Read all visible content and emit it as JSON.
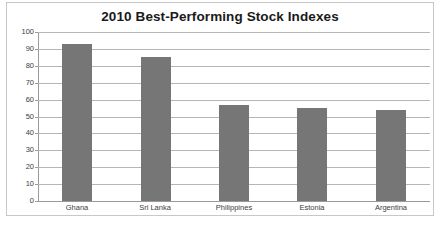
{
  "chart_data": {
    "type": "bar",
    "title": "2010 Best-Performing Stock Indexes",
    "categories": [
      "Ghana",
      "Sri Lanka",
      "Philippines",
      "Estonia",
      "Argentina"
    ],
    "values": [
      93,
      85,
      57,
      55,
      54
    ],
    "series": [
      {
        "name": "2010 return",
        "values": [
          93,
          85,
          57,
          55,
          54
        ]
      }
    ],
    "xlabel": "",
    "ylabel": "",
    "ylim": [
      0,
      100
    ],
    "ytick_labels": [
      "100",
      "90",
      "80",
      "70",
      "60",
      "50",
      "40",
      "30",
      "20",
      "10",
      "0"
    ],
    "ytick_values": [
      100,
      90,
      80,
      70,
      60,
      50,
      40,
      30,
      20,
      10,
      0
    ],
    "ytick_step": 10,
    "grid": true,
    "grid_axis": "y",
    "legend": false,
    "legend_position": "none",
    "bar_color": "#767676",
    "grid_color": "#b6b6b6",
    "axis_color": "#9a9a9a",
    "title_color": "#1a1a1a",
    "tick_label_color": "#3d3d3d",
    "background_color": "#ffffff",
    "border_color": "#c8c8c8"
  }
}
